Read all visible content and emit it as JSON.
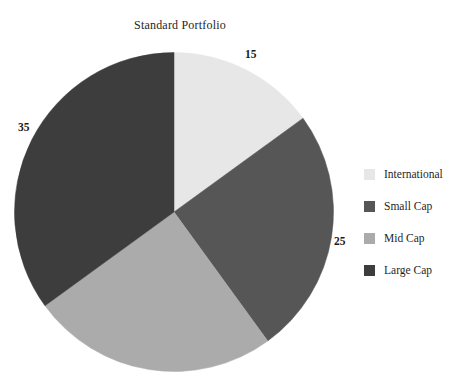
{
  "chart_data": {
    "type": "pie",
    "title": "Standard Portfolio",
    "xlabel": "",
    "ylabel": "",
    "legend_position": "right",
    "grid": false,
    "start_angle_deg": 0,
    "direction": "clockwise",
    "categories": [
      "International",
      "Small Cap",
      "Mid Cap",
      "Large Cap"
    ],
    "values": [
      15,
      25,
      25,
      35
    ],
    "labels_shown": [
      "15",
      "25",
      "35"
    ],
    "colors": [
      "#e7e7e7",
      "#565656",
      "#ababab",
      "#3d3d3d"
    ],
    "slices": [
      {
        "name": "International",
        "value": 15,
        "label": "15",
        "color": "#e7e7e7",
        "start_deg": 0,
        "end_deg": 54
      },
      {
        "name": "Small Cap",
        "value": 25,
        "label": "25",
        "color": "#565656",
        "start_deg": 54,
        "end_deg": 144
      },
      {
        "name": "Mid Cap",
        "value": 25,
        "label": "",
        "color": "#ababab",
        "start_deg": 144,
        "end_deg": 234
      },
      {
        "name": "Large Cap",
        "value": 35,
        "label": "35",
        "color": "#3d3d3d",
        "start_deg": 234,
        "end_deg": 360
      }
    ]
  },
  "chart": {
    "title": "Standard Portfolio",
    "background": "#ffffff"
  },
  "data_labels": {
    "international": "15",
    "small_cap": "25",
    "large_cap": "35"
  },
  "legend": {
    "items": [
      {
        "label": "International",
        "color": "#e7e7e7"
      },
      {
        "label": "Small Cap",
        "color": "#565656"
      },
      {
        "label": "Mid Cap",
        "color": "#ababab"
      },
      {
        "label": "Large Cap",
        "color": "#3d3d3d"
      }
    ]
  }
}
